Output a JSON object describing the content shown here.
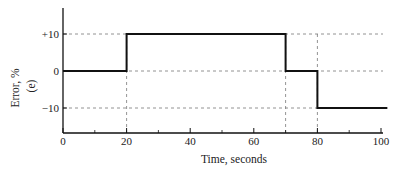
{
  "chart_data": {
    "type": "line",
    "title": "",
    "xlabel": "Time, seconds",
    "ylabel_lines": [
      "Error, %",
      "(e)"
    ],
    "xlim": [
      0,
      102
    ],
    "ylim": [
      -16,
      16
    ],
    "x_ticks": [
      0,
      20,
      40,
      60,
      80,
      100
    ],
    "x_tick_labels": [
      "0",
      "20",
      "40",
      "60",
      "80",
      "100"
    ],
    "x_minor_ticks": [
      10,
      30,
      50,
      70,
      90
    ],
    "y_ticks": [
      10,
      0,
      -10
    ],
    "y_tick_labels": [
      "+10",
      "0",
      "−10"
    ],
    "grid": "dashed reference lines at y = +10, 0, -10 and x = 20, 70, 80",
    "ref_h": [
      10,
      0,
      -10
    ],
    "ref_v": [
      20,
      70,
      80
    ],
    "series": [
      {
        "name": "error",
        "step": true,
        "x": [
          0,
          20,
          20,
          70,
          70,
          80,
          80,
          102
        ],
        "y": [
          0,
          0,
          10,
          10,
          0,
          0,
          -10,
          -10
        ],
        "color": "#111111"
      }
    ],
    "legend": "none"
  }
}
